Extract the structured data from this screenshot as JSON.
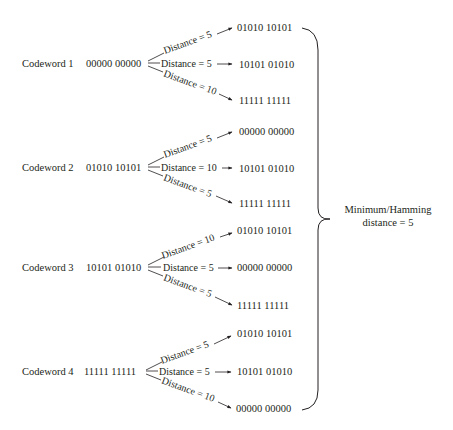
{
  "codewords": [
    {
      "label": "Codeword 1",
      "value": "00000 00000",
      "branches": [
        {
          "distance_label": "Distance = 5",
          "distance": 5,
          "target": "01010 10101"
        },
        {
          "distance_label": "Distance = 5",
          "distance": 5,
          "target": "10101 01010"
        },
        {
          "distance_label": "Distance = 10",
          "distance": 10,
          "target": "11111 11111"
        }
      ]
    },
    {
      "label": "Codeword 2",
      "value": "01010 10101",
      "branches": [
        {
          "distance_label": "Distance = 5",
          "distance": 5,
          "target": "00000 00000"
        },
        {
          "distance_label": "Distance = 10",
          "distance": 10,
          "target": "10101 01010"
        },
        {
          "distance_label": "Distance = 5",
          "distance": 5,
          "target": "11111 11111"
        }
      ]
    },
    {
      "label": "Codeword 3",
      "value": "10101 01010",
      "branches": [
        {
          "distance_label": "Distance = 10",
          "distance": 10,
          "target": "01010 10101"
        },
        {
          "distance_label": "Distance = 5",
          "distance": 5,
          "target": "00000 00000"
        },
        {
          "distance_label": "Distance = 5",
          "distance": 5,
          "target": "11111 11111"
        }
      ]
    },
    {
      "label": "Codeword 4",
      "value": "11111 11111",
      "branches": [
        {
          "distance_label": "Distance = 5",
          "distance": 5,
          "target": "01010 10101"
        },
        {
          "distance_label": "Distance = 5",
          "distance": 5,
          "target": "10101 01010"
        },
        {
          "distance_label": "Distance = 10",
          "distance": 10,
          "target": "00000 00000"
        }
      ]
    }
  ],
  "summary": {
    "line1": "Minimum/Hamming",
    "line2": "distance = 5"
  }
}
